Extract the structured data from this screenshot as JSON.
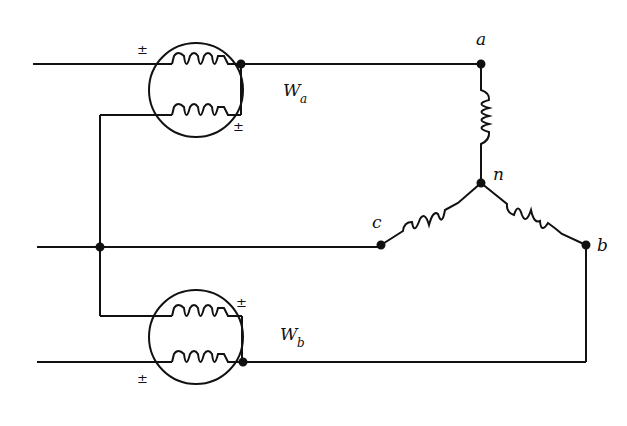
{
  "diagram": {
    "type": "two-wattmeter three-phase wye-connected load circuit",
    "wattmeters": [
      {
        "id": "Wa",
        "label_main": "W",
        "label_sub": "a",
        "polarity_marks": [
          "±",
          "±"
        ]
      },
      {
        "id": "Wb",
        "label_main": "W",
        "label_sub": "b",
        "polarity_marks": [
          "±",
          "±"
        ]
      }
    ],
    "nodes": {
      "a": "a",
      "b": "b",
      "c": "c",
      "n": "n"
    },
    "colors": {
      "line": "#111111",
      "background": "#ffffff"
    }
  }
}
